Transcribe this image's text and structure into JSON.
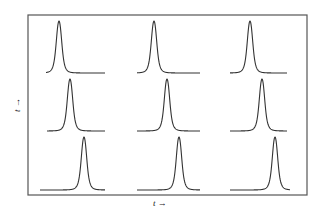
{
  "figure": {
    "x_label": "t →",
    "y_label": "t →",
    "frame": {
      "x": 28,
      "y": 15,
      "width": 279,
      "height": 180
    },
    "stroke_color": "#333333",
    "frame_color": "#555555"
  },
  "panels": [
    {
      "row": 1,
      "col": 1,
      "peak_x": 59,
      "peak_top": 21,
      "baseline_y": 73,
      "x_start": 46,
      "x_end": 105
    },
    {
      "row": 1,
      "col": 2,
      "peak_x": 154,
      "peak_top": 21,
      "baseline_y": 73,
      "x_start": 137,
      "x_end": 200
    },
    {
      "row": 1,
      "col": 3,
      "peak_x": 250,
      "peak_top": 21,
      "baseline_y": 73,
      "x_start": 230,
      "x_end": 287
    },
    {
      "row": 2,
      "col": 1,
      "peak_x": 70,
      "peak_top": 79,
      "baseline_y": 131,
      "x_start": 47,
      "x_end": 105
    },
    {
      "row": 2,
      "col": 2,
      "peak_x": 167,
      "peak_top": 79,
      "baseline_y": 131,
      "x_start": 137,
      "x_end": 200
    },
    {
      "row": 2,
      "col": 3,
      "peak_x": 262,
      "peak_top": 79,
      "baseline_y": 131,
      "x_start": 230,
      "x_end": 287
    },
    {
      "row": 3,
      "col": 1,
      "peak_x": 84,
      "peak_top": 137,
      "baseline_y": 190,
      "x_start": 40,
      "x_end": 105
    },
    {
      "row": 3,
      "col": 2,
      "peak_x": 179,
      "peak_top": 137,
      "baseline_y": 190,
      "x_start": 137,
      "x_end": 200
    },
    {
      "row": 3,
      "col": 3,
      "peak_x": 275,
      "peak_top": 137,
      "baseline_y": 190,
      "x_start": 230,
      "x_end": 290
    }
  ]
}
